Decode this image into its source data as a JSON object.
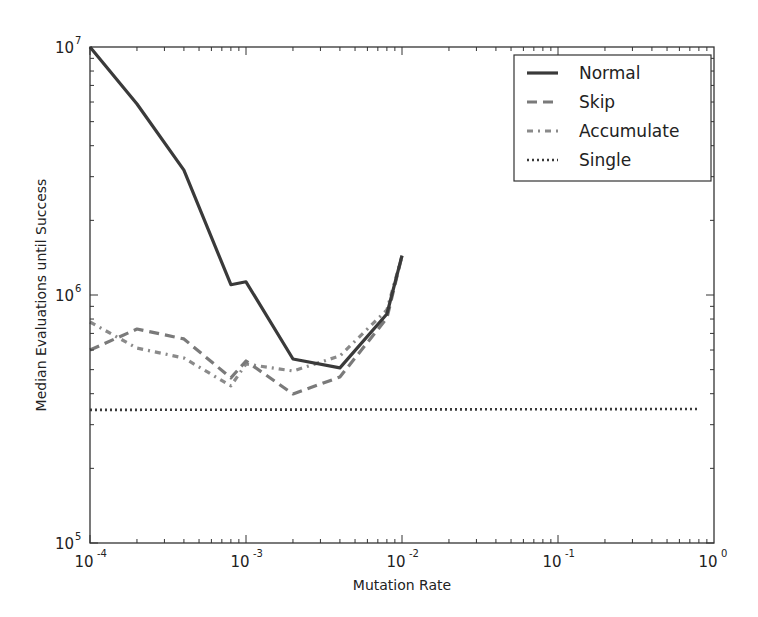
{
  "chart_data": {
    "type": "line",
    "title": "",
    "xlabel": "Mutation Rate",
    "ylabel": "Median Evaluations until Success",
    "xscale": "log",
    "yscale": "log",
    "xlim": [
      0.0001,
      1
    ],
    "ylim": [
      100000,
      10000000
    ],
    "grid": false,
    "legend_position": "upper right",
    "x_ticks": [
      {
        "value": 0.0001,
        "base": "10",
        "exp": "-4"
      },
      {
        "value": 0.001,
        "base": "10",
        "exp": "-3"
      },
      {
        "value": 0.01,
        "base": "10",
        "exp": "-2"
      },
      {
        "value": 0.1,
        "base": "10",
        "exp": "-1"
      },
      {
        "value": 1,
        "base": "10",
        "exp": "0"
      }
    ],
    "y_ticks": [
      {
        "value": 100000,
        "base": "10",
        "exp": "5"
      },
      {
        "value": 1000000,
        "base": "10",
        "exp": "6"
      },
      {
        "value": 10000000,
        "base": "10",
        "exp": "7"
      }
    ],
    "series": [
      {
        "name": "Normal",
        "style": "solid",
        "color": "#3a3a3a",
        "x": [
          0.0001,
          0.0002,
          0.0004,
          0.0008,
          0.001,
          0.002,
          0.004,
          0.008,
          0.01
        ],
        "values": [
          10000000,
          5890000,
          3190000,
          1100000,
          1130000,
          552000,
          508000,
          838000,
          1440000
        ]
      },
      {
        "name": "Skip",
        "style": "dashed",
        "color": "#7a7a7a",
        "x": [
          0.0001,
          0.0002,
          0.0004,
          0.0008,
          0.001,
          0.002,
          0.004,
          0.008,
          0.01
        ],
        "values": [
          600000,
          729000,
          665000,
          463000,
          542000,
          399000,
          467000,
          807000,
          1440000
        ]
      },
      {
        "name": "Accumulate",
        "style": "dashdot",
        "color": "#8a8a8a",
        "x": [
          0.0001,
          0.0002,
          0.0004,
          0.0008,
          0.001,
          0.002,
          0.004,
          0.008,
          0.01
        ],
        "values": [
          778000,
          611000,
          557000,
          430000,
          527000,
          494000,
          568000,
          871000,
          1440000
        ]
      },
      {
        "name": "Single",
        "style": "dotted",
        "color": "#3a3a3a",
        "x": [
          0.0001,
          0.8
        ],
        "values": [
          344000,
          347000
        ]
      }
    ]
  }
}
